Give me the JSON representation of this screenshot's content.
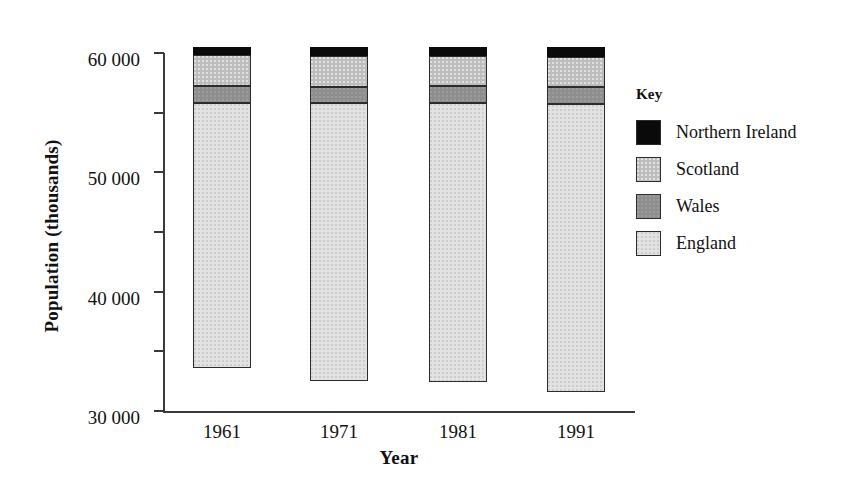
{
  "chart_data": {
    "type": "bar",
    "subtype": "stacked-bar",
    "title": "",
    "xlabel": "Year",
    "ylabel": "Population (thousands)",
    "categories": [
      "1961",
      "1971",
      "1981",
      "1991"
    ],
    "ylim": [
      0,
      60000
    ],
    "ytick_values": [
      0,
      10000,
      20000,
      30000,
      40000,
      50000,
      60000
    ],
    "ytick_labels": [
      "0",
      "10 000",
      "20 000",
      "30 000",
      "40 000",
      "50 000",
      "60 000"
    ],
    "grid": false,
    "legend_position": "right",
    "legend_title": "Key",
    "series": [
      {
        "name": "England",
        "color": "#e2e2e2",
        "values": [
          44500,
          46600,
          46800,
          48200
        ]
      },
      {
        "name": "Wales",
        "color": "#8e8e8e",
        "values": [
          2700,
          2700,
          2800,
          2900
        ]
      },
      {
        "name": "Scotland",
        "color": "#bdbdbd",
        "values": [
          5200,
          5200,
          5100,
          5100
        ]
      },
      {
        "name": "Northern Ireland",
        "color": "#0a0a0a",
        "values": [
          1400,
          1500,
          1500,
          1600
        ]
      }
    ],
    "stack_order_bottom_to_top": [
      "England",
      "Wales",
      "Scotland",
      "Northern Ireland"
    ],
    "totals": [
      53800,
      56000,
      56200,
      57800
    ]
  },
  "axes": {
    "y": {
      "title": "Population (thousands)",
      "ticks": [
        {
          "label": "60 000",
          "value": 60000
        },
        {
          "label": "50 000",
          "value": 50000
        },
        {
          "label": "40 000",
          "value": 40000
        },
        {
          "label": "30 000",
          "value": 30000
        },
        {
          "label": "20 000",
          "value": 20000
        },
        {
          "label": "10 000",
          "value": 10000
        },
        {
          "label": "0",
          "value": 0
        }
      ]
    },
    "x": {
      "title": "Year",
      "ticks": [
        {
          "label": "1961"
        },
        {
          "label": "1971"
        },
        {
          "label": "1981"
        },
        {
          "label": "1991"
        }
      ]
    }
  },
  "legend": {
    "title": "Key",
    "items": [
      {
        "label": "Northern Ireland",
        "color": "#0a0a0a"
      },
      {
        "label": "Scotland",
        "color": "#bdbdbd"
      },
      {
        "label": "Wales",
        "color": "#8e8e8e"
      },
      {
        "label": "England",
        "color": "#e2e2e2"
      }
    ]
  }
}
